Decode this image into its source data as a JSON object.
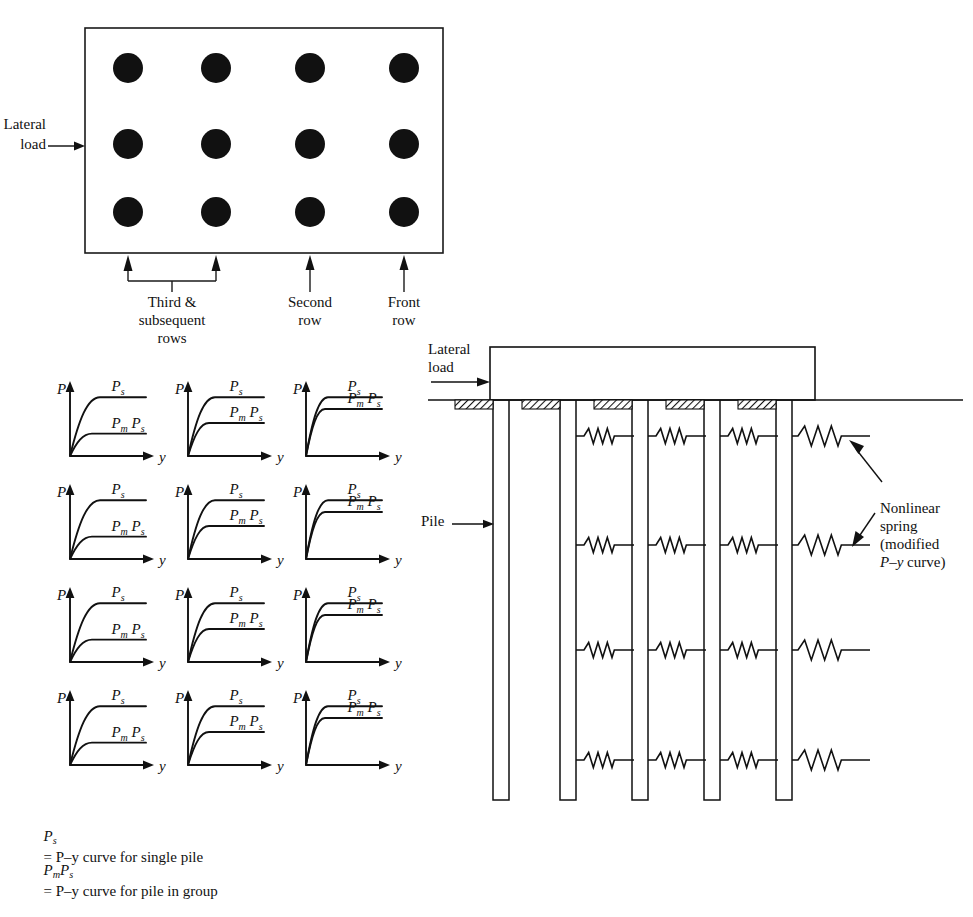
{
  "figure": {
    "domain": "engineering-diagram",
    "title_absent": true,
    "ink_color": "#111111",
    "background_color": "#ffffff"
  },
  "plan_view": {
    "name": "pile-group-plan-view",
    "lateral_load_label_line1": "Lateral",
    "lateral_load_label_line2": "load",
    "box": {
      "x": 85,
      "y": 28,
      "width": 358,
      "height": 225
    },
    "pile_rows": 3,
    "pile_columns": 4,
    "pile_radius": 15,
    "pile_columns_x": [
      128,
      216,
      310,
      404
    ],
    "pile_rows_y": [
      68,
      144,
      212
    ],
    "row_annotations": [
      {
        "label_lines": [
          "Third &",
          "subsequent",
          "rows"
        ],
        "type": "bracket",
        "from_x": 128,
        "to_x": 216,
        "label_center_x": 172
      },
      {
        "label_lines": [
          "Second",
          "row"
        ],
        "type": "arrow",
        "at_x": 310,
        "label_center_x": 310
      },
      {
        "label_lines": [
          "Front",
          "row"
        ],
        "type": "arrow",
        "at_x": 404,
        "label_center_x": 404
      }
    ]
  },
  "curve_grid": {
    "name": "py-curve-matrix",
    "rows": 4,
    "columns": 3,
    "axis_label_y": "P",
    "axis_label_x": "y",
    "curve_upper_label": "Ps",
    "curve_lower_label": "PmPs",
    "cell_width": 118,
    "cell_height": 103,
    "origin": {
      "x": 60,
      "y": 378
    },
    "pm_by_column": [
      0.38,
      0.56,
      0.8
    ],
    "ps_plateau": 0.84,
    "column_meaning": [
      "third-and-subsequent-rows",
      "second-row",
      "front-row"
    ]
  },
  "elevation": {
    "name": "pile-group-elevation-view",
    "lateral_load_label_line1": "Lateral",
    "lateral_load_label_line2": "load",
    "pile_label": "Pile",
    "cap": {
      "x": 490,
      "y": 347,
      "width": 325,
      "height": 53
    },
    "ground_line_y": 400,
    "pile_count": 5,
    "pile_width": 16,
    "pile_x": [
      493,
      560,
      632,
      704,
      776
    ],
    "pile_bottom_y": 800,
    "spring_levels_y": [
      436,
      545,
      650,
      760
    ],
    "spring_annotation": {
      "lines": [
        "Nonlinear",
        "spring",
        "(modified",
        "P-y curve)"
      ],
      "label_x": 880,
      "label_y": 503
    }
  },
  "legend": {
    "name": "figure-legend",
    "entries": [
      {
        "symbol_main": "P",
        "symbol_sub": "s",
        "definition": "= P–y curve for single pile"
      },
      {
        "symbol_main": "PmPs",
        "definition": "= P–y curve for pile in group"
      }
    ],
    "line1_plain": "P–y curve for single pile",
    "line2_plain": "P–y curve for pile in group"
  }
}
